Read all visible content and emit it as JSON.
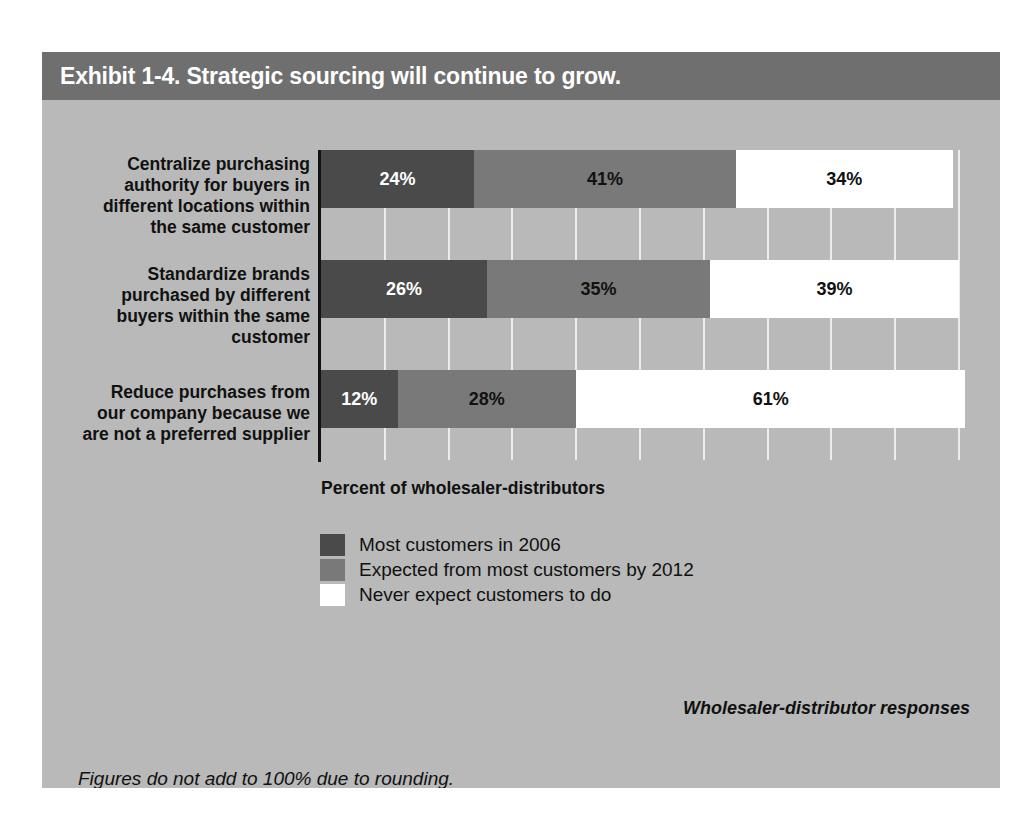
{
  "exhibit": {
    "title": "Exhibit 1-4. Strategic sourcing will continue to grow.",
    "axis_caption": "Percent of wholesaler-distributors",
    "source_note": "Wholesaler-distributor responses",
    "rounding_note": "Figures do not add to 100% due to rounding."
  },
  "colors": {
    "card_background": "#b9b9b9",
    "header_band": "#6f6f6f",
    "header_text": "#ffffff",
    "series_most_customers_2006": "#4a4a4a",
    "series_expected_by_2012": "#797979",
    "series_never_expect": "#ffffff",
    "gridline": "#ededed",
    "axis_line": "#111111",
    "body_text": "#111111"
  },
  "legend": {
    "position": "below-chart",
    "items": [
      {
        "label": "Most customers in 2006",
        "swatch_class": "sw-now"
      },
      {
        "label": "Expected from most customers by 2012",
        "swatch_class": "sw-future"
      },
      {
        "label": "Never expect customers to do",
        "swatch_class": "sw-never"
      }
    ]
  },
  "chart_data": {
    "type": "bar",
    "orientation": "horizontal",
    "stacked": true,
    "title": "Exhibit 1-4. Strategic sourcing will continue to grow.",
    "xlabel": "Percent of wholesaler-distributors",
    "ylabel": "",
    "xlim": [
      0,
      100
    ],
    "xtick_values": [
      0,
      10,
      20,
      30,
      40,
      50,
      60,
      70,
      80,
      90,
      100
    ],
    "xtick_labels": [],
    "grid": true,
    "legend_position": "below",
    "categories": [
      "Centralize purchasing authority for buyers in different locations within the same customer",
      "Standardize brands purchased by different buyers within the same customer",
      "Reduce purchases from our company because we are not a preferred supplier"
    ],
    "series": [
      {
        "name": "Most customers in 2006",
        "color": "#4a4a4a",
        "values": [
          24,
          26,
          12
        ]
      },
      {
        "name": "Expected from most customers by 2012",
        "color": "#797979",
        "values": [
          41,
          35,
          28
        ]
      },
      {
        "name": "Never expect customers to do",
        "color": "#ffffff",
        "values": [
          34,
          39,
          61
        ]
      }
    ],
    "data_labels": [
      [
        "24%",
        "41%",
        "34%"
      ],
      [
        "26%",
        "35%",
        "39%"
      ],
      [
        "12%",
        "28%",
        "61%"
      ]
    ],
    "notes": [
      "Wholesaler-distributor responses",
      "Figures do not add to 100% due to rounding."
    ]
  },
  "rows": [
    {
      "label_lines": [
        "Centralize purchasing",
        "authority for buyers in",
        "different locations within",
        "the same customer"
      ],
      "top": 50,
      "label_top": 54,
      "segments": [
        {
          "value": 24,
          "label": "24%",
          "class": "seg-now"
        },
        {
          "value": 41,
          "label": "41%",
          "class": "seg-future"
        },
        {
          "value": 34,
          "label": "34%",
          "class": "seg-never"
        }
      ]
    },
    {
      "label_lines": [
        "Standardize brands",
        "purchased by different",
        "buyers within the same",
        "customer"
      ],
      "top": 160,
      "label_top": 164,
      "segments": [
        {
          "value": 26,
          "label": "26%",
          "class": "seg-now"
        },
        {
          "value": 35,
          "label": "35%",
          "class": "seg-future"
        },
        {
          "value": 39,
          "label": "39%",
          "class": "seg-never"
        }
      ]
    },
    {
      "label_lines": [
        "Reduce purchases from",
        "our company because we",
        "are not a preferred supplier"
      ],
      "top": 270,
      "label_top": 282,
      "segments": [
        {
          "value": 12,
          "label": "12%",
          "class": "seg-now"
        },
        {
          "value": 28,
          "label": "28%",
          "class": "seg-future"
        },
        {
          "value": 61,
          "label": "61%",
          "class": "seg-never"
        }
      ]
    }
  ]
}
